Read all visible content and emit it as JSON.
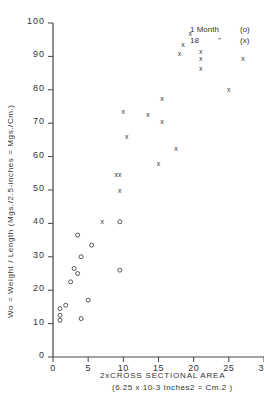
{
  "chart_data": {
    "type": "scatter",
    "title": "",
    "xlabel": "2 x CROSS SECTIONAL AREA",
    "xlabel_units": "(6.25 x 10^-3 Inches^2 = Cm.^2)",
    "ylabel": "Wo = Weight / Length (Mgs./2.5-inches = Mgs./Cm.)",
    "xlim": [
      0,
      30
    ],
    "ylim": [
      0,
      100
    ],
    "xticks": [
      0,
      5,
      10,
      15,
      20,
      25,
      30
    ],
    "yticks": [
      0,
      10,
      20,
      30,
      40,
      50,
      60,
      70,
      80,
      90,
      100
    ],
    "grid": false,
    "legend_position": "top-right",
    "series": [
      {
        "name": "1 Month",
        "marker": "o",
        "points": [
          [
            1.0,
            11
          ],
          [
            1.0,
            12.5
          ],
          [
            1.0,
            14.5
          ],
          [
            1.8,
            15.5
          ],
          [
            2.5,
            22.5
          ],
          [
            3.0,
            26.5
          ],
          [
            3.5,
            25
          ],
          [
            3.5,
            36.5
          ],
          [
            4.0,
            30
          ],
          [
            4.0,
            11.5
          ],
          [
            5.0,
            17
          ],
          [
            5.5,
            33.5
          ],
          [
            9.5,
            40.5
          ],
          [
            9.5,
            26
          ]
        ]
      },
      {
        "name": "18 Months",
        "marker": "x",
        "points": [
          [
            7.0,
            40.5
          ],
          [
            9.0,
            54.5
          ],
          [
            9.5,
            54.5
          ],
          [
            9.5,
            50
          ],
          [
            10.0,
            73.5
          ],
          [
            10.5,
            66
          ],
          [
            13.5,
            72.5
          ],
          [
            15.0,
            58
          ],
          [
            15.5,
            70.5
          ],
          [
            15.5,
            77.5
          ],
          [
            17.5,
            62.5
          ],
          [
            18.0,
            91
          ],
          [
            18.5,
            93.5
          ],
          [
            19.5,
            97
          ],
          [
            21.0,
            91.5
          ],
          [
            21.0,
            89.5
          ],
          [
            21.0,
            86.5
          ],
          [
            25.0,
            80
          ],
          [
            27.0,
            89.5
          ]
        ]
      }
    ]
  },
  "axes": {
    "y_tick_labels": [
      "0",
      "10",
      "20",
      "30",
      "40",
      "50",
      "60",
      "70",
      "80",
      "90",
      "100"
    ],
    "x_tick_labels": [
      "0",
      "5",
      "10",
      "15",
      "20",
      "25",
      "30"
    ],
    "ylabel_text": "Wo = Weight / Length     (Mgs./2.5-inches = Mgs./Cm.)",
    "xlabel_line1": "2xCROSS SECTIONAL AREA",
    "xlabel_line2": "(6.25 x 10-3 Inches2 = Cm.2 )"
  },
  "legend": {
    "rows": [
      {
        "label": "1 Month",
        "ditto": "",
        "marker": "(o)"
      },
      {
        "label": "18",
        "ditto": "\"",
        "marker": "(x)"
      }
    ]
  }
}
